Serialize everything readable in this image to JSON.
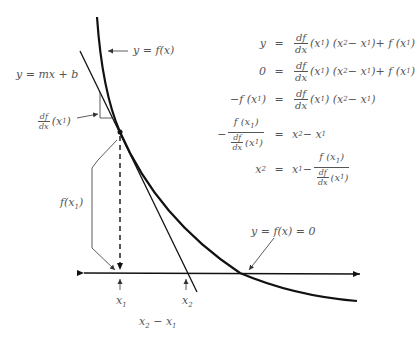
{
  "diagram": {
    "labels": {
      "curve": "y = f(x)",
      "tangent": "y = mx + b",
      "slope": "df/dx (x1)",
      "slope_num": "df",
      "slope_den": "dx",
      "slope_arg": "(x",
      "fx1": "f(x",
      "root": "y = f(x) = 0",
      "x1": "x",
      "x2": "x",
      "x1_sub": "1",
      "x2_sub": "2",
      "delta": "x",
      "delta_rest": " − x",
      "delta_sub2": "2",
      "delta_sub1": "1"
    },
    "equations": [
      {
        "lhs": "y",
        "sign": "=",
        "rhs": "df/dx (x1) (x2 − x1) + f (x1)"
      },
      {
        "lhs": "0",
        "sign": "=",
        "rhs": "df/dx (x1) (x2 − x1) + f (x1)"
      },
      {
        "lhs": "−f (x1)",
        "sign": "=",
        "rhs": "df/dx (x1) (x2 − x1)"
      },
      {
        "lhs": "−f (x1) / (df/dx (x1))",
        "sign": "=",
        "rhs": "x2 − x1"
      },
      {
        "lhs": "x2",
        "sign": "=",
        "rhs": "x1 − f (x1) / (df/dx (x1))"
      }
    ],
    "eq_text": {
      "y": "y",
      "zero": "0",
      "eq": "=",
      "df": "df",
      "dx": "dx",
      "x1p": "(x",
      "one": "1",
      "two": "2",
      "close": ")",
      "x2mx1_open": "(x",
      "minus_x": " − x",
      "plus_f": " + f (x",
      "neg_f": "−f (x",
      "f": "f (x",
      "x": "x",
      "minus": "−",
      "x1_minus": " − "
    },
    "colors": {
      "stroke": "#111111",
      "thin": "#333333",
      "text": "#555555"
    }
  }
}
